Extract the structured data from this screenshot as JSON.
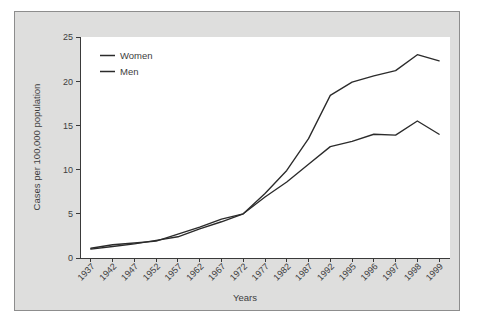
{
  "figure": {
    "background_color": "#dededd",
    "plot_background_color": "#ffffff",
    "border_color": "#8d8d8d",
    "line_color": "#2b2b2b"
  },
  "chart_data": {
    "type": "line",
    "title": "",
    "xlabel": "Years",
    "ylabel": "Cases per 100,000 population",
    "categories": [
      "1937",
      "1942",
      "1947",
      "1952",
      "1957",
      "1962",
      "1967",
      "1972",
      "1977",
      "1982",
      "1987",
      "1992",
      "1995",
      "1996",
      "1997",
      "1998",
      "1999"
    ],
    "yticks": [
      "0",
      "5",
      "10",
      "15",
      "20",
      "25"
    ],
    "ylim": [
      0,
      25
    ],
    "grid": false,
    "legend_position": "top-left",
    "series": [
      {
        "name": "Women",
        "values": [
          1.0,
          1.3,
          1.6,
          2.0,
          2.4,
          3.3,
          4.1,
          5.0,
          6.9,
          8.6,
          10.6,
          12.6,
          13.2,
          14.0,
          13.9,
          15.5,
          14.0
        ]
      },
      {
        "name": "Men",
        "values": [
          1.1,
          1.5,
          1.7,
          1.9,
          2.7,
          3.5,
          4.4,
          5.0,
          7.3,
          9.9,
          13.5,
          18.4,
          19.9,
          20.6,
          21.2,
          23.0,
          22.3
        ]
      }
    ]
  },
  "legend": {
    "items": [
      {
        "label": "Women"
      },
      {
        "label": "Men"
      }
    ]
  }
}
